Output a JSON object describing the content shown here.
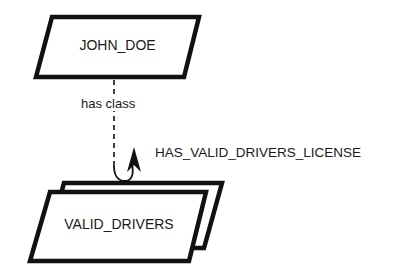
{
  "diagram": {
    "type": "semantic-network",
    "nodes": [
      {
        "id": "instance",
        "label": "JOHN_DOE",
        "shape": "parallelogram"
      },
      {
        "id": "class",
        "label": "VALID_DRIVERS",
        "shape": "stacked-parallelogram"
      }
    ],
    "edges": [
      {
        "from": "instance",
        "to": "class",
        "label": "has class",
        "style": "dashed"
      }
    ],
    "annotations": [
      {
        "label": "HAS_VALID_DRIVERS_LICENSE",
        "attached_to": "class",
        "marker": "curved-arrow"
      }
    ]
  },
  "colors": {
    "stroke": "#111111",
    "background": "#ffffff",
    "text": "#1a1a1a"
  }
}
